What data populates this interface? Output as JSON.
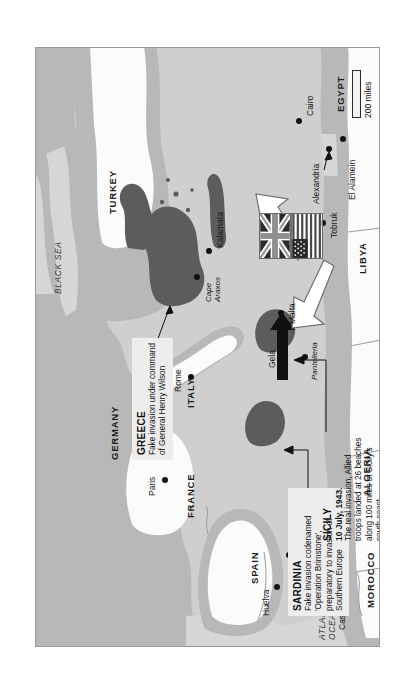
{
  "map": {
    "title": "Operation Mincemeat deception map, Mediterranean 1943",
    "scale": {
      "label": "200 miles"
    },
    "water_labels": [
      {
        "name": "ATLANTIC OCEAN",
        "line1": "ATLANTIC",
        "line2": "OCEAN"
      },
      {
        "name": "BLACK SEA",
        "line1": "BLACK SEA",
        "line2": ""
      }
    ],
    "countries": [
      {
        "label": "GERMANY"
      },
      {
        "label": "FRANCE"
      },
      {
        "label": "ITALY"
      },
      {
        "label": "SPAIN"
      },
      {
        "label": "TURKEY"
      },
      {
        "label": "GREECE"
      },
      {
        "label": "EGYPT"
      },
      {
        "label": "LIBYA"
      },
      {
        "label": "ALGERIA"
      },
      {
        "label": "MOROCCO"
      },
      {
        "label": "SARDINIA"
      },
      {
        "label": "SICILY"
      }
    ],
    "cities": [
      {
        "label": "Paris"
      },
      {
        "label": "Rome"
      },
      {
        "label": "Huelva"
      },
      {
        "label": "Gibraltar"
      },
      {
        "label": "Casablanca"
      },
      {
        "label": "Gela"
      },
      {
        "label": "Malta"
      },
      {
        "label": "Pantelleria"
      },
      {
        "label": "Cape Araxos",
        "line1": "Cape",
        "line2": "Araxos"
      },
      {
        "label": "Kalamata"
      },
      {
        "label": "Alexandria"
      },
      {
        "label": "El Alamein"
      },
      {
        "label": "Cairo"
      },
      {
        "label": "Tobruk"
      }
    ],
    "callouts": [
      {
        "id": "greece",
        "heading": "GREECE",
        "body": "Fake invasion under command of General Henry Wilson"
      },
      {
        "id": "sardinia",
        "heading": "SARDINIA",
        "body": "Fake invasion codenamed 'Operation Brimstone', preparatory to invasion of Southern Europe"
      },
      {
        "id": "sicily",
        "heading": "SICILY",
        "subheading": "10 July, 1943.",
        "body": "The real invasion, Allied troops landed at 26 beaches along 100 miles of Sicily's south coast"
      }
    ],
    "symbols": [
      {
        "name": "swastika-icon",
        "meaning": "Nazi Germany"
      },
      {
        "name": "union-jack-flag",
        "meaning": "United Kingdom"
      },
      {
        "name": "united-states-flag",
        "meaning": "United States"
      },
      {
        "name": "black-arrow-real-invasion",
        "meaning": "Real invasion route to Sicily"
      },
      {
        "name": "white-arrow-fake-invasion-greece",
        "meaning": "Fake invasion route to Greece"
      },
      {
        "name": "white-arrow-fake-invasion-sardinia",
        "meaning": "Fake invasion route to Sardinia"
      }
    ],
    "colors": {
      "sea": "#d6d6d6",
      "land": "#b8b8b8",
      "target_land": "#5c5c5c",
      "neutral_land": "#fbfbfb",
      "callout_bg": "#ededed",
      "ink": "#111111"
    }
  }
}
